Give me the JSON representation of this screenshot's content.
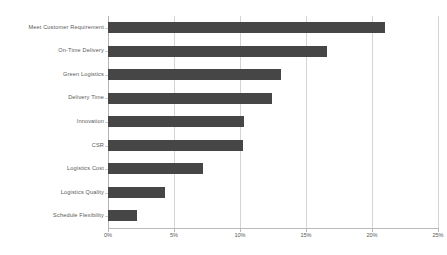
{
  "chart_data": {
    "type": "bar",
    "orientation": "horizontal",
    "title": "",
    "subtitle": "",
    "xlabel": "",
    "ylabel": "",
    "categories": [
      "Meet Customer Requirement",
      "On-Time Delivery",
      "Green Logistics",
      "Delivery Time",
      "Innovation",
      "CSR",
      "Logistics Cost",
      "Logistics Quality",
      "Schedule Flexibility"
    ],
    "values": [
      21.0,
      16.6,
      13.1,
      12.4,
      10.3,
      10.2,
      7.2,
      4.3,
      2.2
    ],
    "value_unit": "%",
    "xlim": [
      0,
      25
    ],
    "x_ticks": [
      0,
      5,
      10,
      15,
      20,
      25
    ],
    "x_tick_labels": [
      "0%",
      "5%",
      "10%",
      "15%",
      "20%",
      "25%"
    ],
    "grid": "vertical",
    "legend": "none",
    "bar_color": "#464646",
    "grid_color": "#d4d4d4",
    "text_color": "#595959",
    "background_color": "#ffffff"
  }
}
